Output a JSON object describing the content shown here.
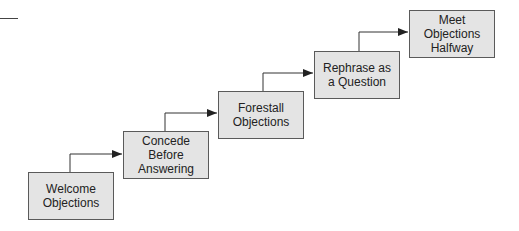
{
  "diagram": {
    "type": "staircase-flow",
    "steps": [
      {
        "label": "Welcome\nObjections"
      },
      {
        "label": "Concede\nBefore\nAnswering"
      },
      {
        "label": "Forestall\nObjections"
      },
      {
        "label": "Rephrase as\na Question"
      },
      {
        "label": "Meet\nObjections\nHalfway"
      }
    ],
    "colors": {
      "box_fill": "#e4e4e4",
      "box_border": "#5a5a5a",
      "connector": "#333333"
    }
  }
}
